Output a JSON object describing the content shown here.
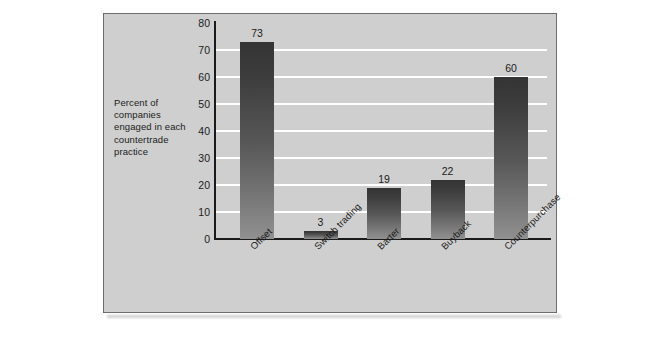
{
  "page": {
    "background_color": "#ffffff",
    "panel_color": "#cfcfcf",
    "panel_border_color": "#6e6e6e",
    "bar_color_top": "#343434",
    "bar_color_bottom": "#919191",
    "gridline_color": "#ffffff",
    "axis_color": "#1a1a1a",
    "text_color": "#1b1b1b"
  },
  "caption": {
    "text": "Percent of companies engaged in each countertrade practice"
  },
  "chart_data": {
    "type": "bar",
    "title": "",
    "subtitle": "",
    "categories": [
      "Offset",
      "Switch trading",
      "Barter",
      "Buyback",
      "Counterpurchase"
    ],
    "values": [
      73,
      3,
      19,
      22,
      60
    ],
    "data_labels": [
      "73",
      "3",
      "19",
      "22",
      "60"
    ],
    "xlabel": "",
    "ylabel": "Percent of companies engaged in each countertrade practice",
    "ylim": [
      0,
      80
    ],
    "ytick_values": [
      0,
      10,
      20,
      30,
      40,
      50,
      60,
      70,
      80
    ],
    "ytick_labels": [
      "0",
      "10",
      "20",
      "30",
      "40",
      "50",
      "60",
      "70",
      "80"
    ],
    "grid": true,
    "grid_axis": "y",
    "legend": false,
    "legend_position": "none",
    "xtick_rotation_degrees": -45
  }
}
